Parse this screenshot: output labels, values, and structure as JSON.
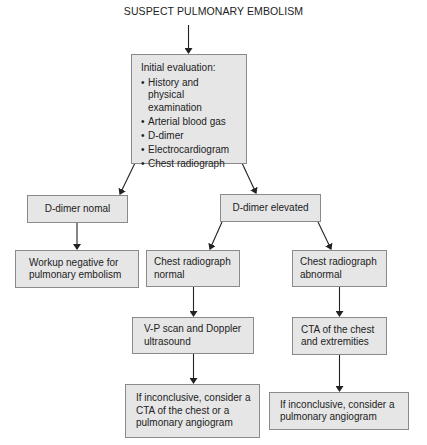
{
  "title": "SUSPECT PULMONARY EMBOLISM",
  "nodes": {
    "initial": {
      "heading": "Initial evaluation:",
      "items": [
        "History and physical examination",
        "Arterial blood gas",
        "D-dimer",
        "Electrocardiogram",
        "Chest radiograph"
      ]
    },
    "ddimer_normal": {
      "line1": "D-dimer nomal"
    },
    "ddimer_elevated": {
      "line1": "D-dimer elevated"
    },
    "workup_negative": {
      "line1": "Workup negative for",
      "line2": "pulmonary embolism"
    },
    "cxr_normal": {
      "line1": "Chest radiograph",
      "line2": "normal"
    },
    "cxr_abnormal": {
      "line1": "Chest radiograph",
      "line2": "abnormal"
    },
    "vp_scan": {
      "line1": "V-P scan and Doppler",
      "line2": "ultrasound"
    },
    "cta_chest": {
      "line1": "CTA of the chest",
      "line2": "and extremities"
    },
    "inconclusive_left": {
      "line1": "If inconclusive, consider a",
      "line2": "CTA of the chest or a",
      "line3": "pulmonary angiogram"
    },
    "inconclusive_right": {
      "line1": "If inconclusive, consider a",
      "line2": "pulmonary angiogram"
    }
  },
  "colors": {
    "box_fill": "#e6e6e6",
    "box_border": "#8a8a8a",
    "arrow": "#222222"
  }
}
